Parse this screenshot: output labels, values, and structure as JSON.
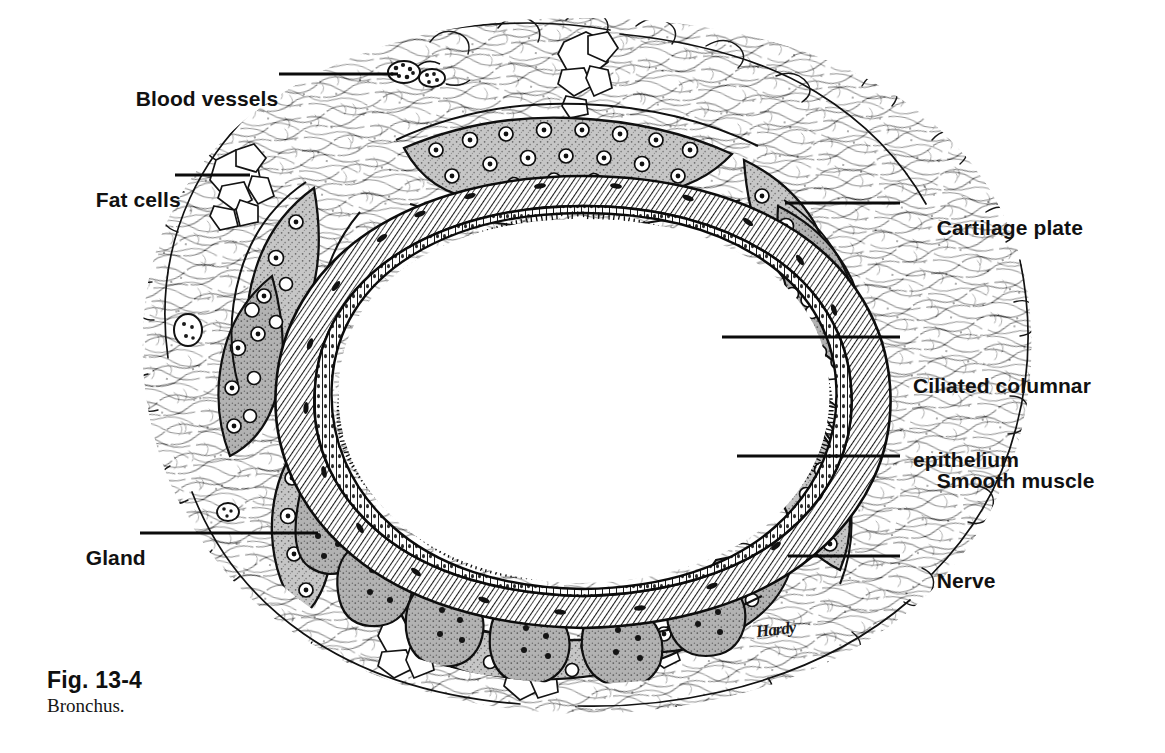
{
  "figure": {
    "caption_number": "Fig. 13-4",
    "caption_title": "Bronchus.",
    "signature": "Hardy",
    "background_color": "#ffffff",
    "ink_color": "#111111",
    "cartilage_fill": "#b9b9b9",
    "gland_fill": "#a8a8a8",
    "lumen_fill": "#ffffff"
  },
  "labels": {
    "blood_vessels": {
      "text": "Blood vessels",
      "side": "left",
      "text_x": 112,
      "text_y": 62,
      "leader_x1": 279,
      "leader_y1": 74,
      "leader_x2": 398,
      "leader_y2": 74
    },
    "fat_cells": {
      "text": "Fat cells",
      "side": "left",
      "text_x": 72,
      "text_y": 163,
      "leader_x1": 175,
      "leader_y1": 175,
      "leader_x2": 250,
      "leader_y2": 175
    },
    "gland": {
      "text": "Gland",
      "side": "left",
      "text_x": 62,
      "text_y": 521,
      "leader_x1": 140,
      "leader_y1": 533,
      "leader_x2": 318,
      "leader_y2": 533
    },
    "cartilage_plate": {
      "text": "Cartilage plate",
      "side": "right",
      "text_x": 913,
      "text_y": 191,
      "leader_x1": 785,
      "leader_y1": 203,
      "leader_x2": 900,
      "leader_y2": 203
    },
    "ciliated_columnar_epithelium": {
      "text": "Ciliated columnar\nepithelium",
      "line1": "Ciliated columnar",
      "line2": "epithelium",
      "side": "right",
      "text_x": 913,
      "text_y": 325,
      "leader_x1": 722,
      "leader_y1": 337,
      "leader_x2": 900,
      "leader_y2": 337
    },
    "smooth_muscle": {
      "text": "Smooth muscle",
      "side": "right",
      "text_x": 913,
      "text_y": 444,
      "leader_x1": 737,
      "leader_y1": 456,
      "leader_x2": 900,
      "leader_y2": 456
    },
    "nerve": {
      "text": "Nerve",
      "side": "right",
      "text_x": 913,
      "text_y": 544,
      "leader_x1": 788,
      "leader_y1": 556,
      "leader_x2": 900,
      "leader_y2": 556
    }
  },
  "chart_data": {
    "type": "diagram",
    "subject": "Bronchus",
    "view": "transverse section",
    "annotated_structures": [
      "Blood vessels",
      "Fat cells",
      "Cartilage plate",
      "Ciliated columnar epithelium",
      "Smooth muscle",
      "Nerve",
      "Gland"
    ],
    "layers_inner_to_outer": [
      "lumen",
      "ciliated columnar epithelium",
      "lamina propria",
      "smooth muscle",
      "submucosal glands",
      "cartilage plates",
      "adventitia / connective tissue"
    ]
  }
}
